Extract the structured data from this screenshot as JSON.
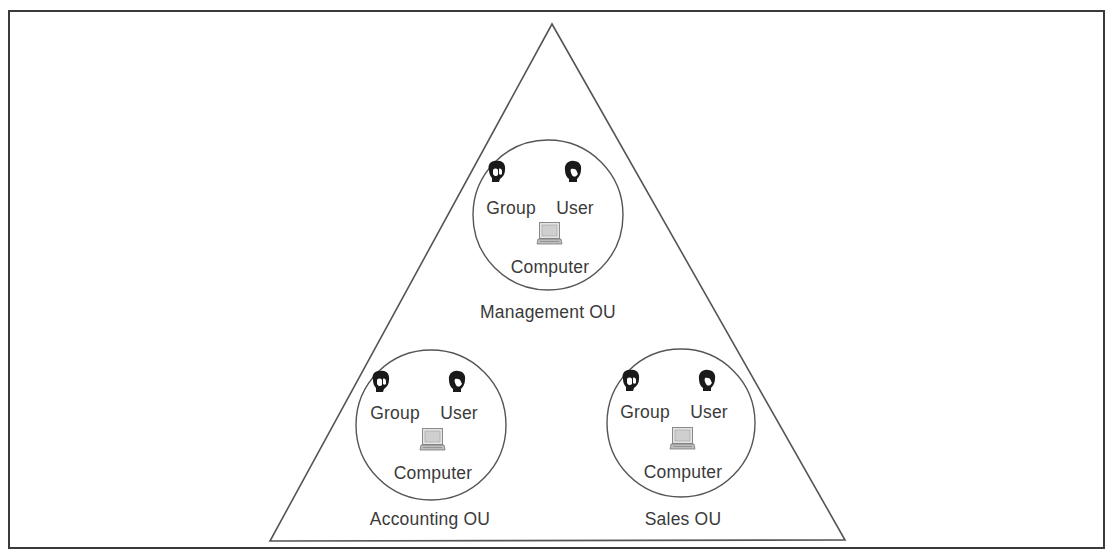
{
  "diagram": {
    "type": "Active Directory domain with organizational units",
    "container_shape": "triangle",
    "colors": {
      "border": "#3a3a3a",
      "line": "#555555",
      "text": "#3a3a3a",
      "icon_dark": "#1a1a1a",
      "icon_light": "#d0d0d0"
    },
    "ous": [
      {
        "name": "Management OU",
        "objects": [
          {
            "label": "Group",
            "icon": "group-icon"
          },
          {
            "label": "User",
            "icon": "user-icon"
          },
          {
            "label": "Computer",
            "icon": "computer-icon"
          }
        ]
      },
      {
        "name": "Accounting OU",
        "objects": [
          {
            "label": "Group",
            "icon": "group-icon"
          },
          {
            "label": "User",
            "icon": "user-icon"
          },
          {
            "label": "Computer",
            "icon": "computer-icon"
          }
        ]
      },
      {
        "name": "Sales OU",
        "objects": [
          {
            "label": "Group",
            "icon": "group-icon"
          },
          {
            "label": "User",
            "icon": "user-icon"
          },
          {
            "label": "Computer",
            "icon": "computer-icon"
          }
        ]
      }
    ]
  }
}
